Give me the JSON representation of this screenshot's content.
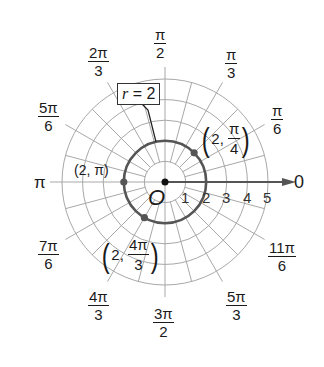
{
  "chart_data": {
    "type": "polar",
    "title": "",
    "center_label": "O",
    "radial_ticks": [
      "1",
      "2",
      "3",
      "4",
      "5"
    ],
    "r_max": 5,
    "angle_grid_step_deg": 15,
    "polar_axis_label": "0",
    "angle_labels": [
      {
        "angle": "π/6",
        "num": "π",
        "den": "6"
      },
      {
        "angle": "π/3",
        "num": "π",
        "den": "3"
      },
      {
        "angle": "π/2",
        "num": "π",
        "den": "2"
      },
      {
        "angle": "2π/3",
        "num": "2π",
        "den": "3"
      },
      {
        "angle": "5π/6",
        "num": "5π",
        "den": "6"
      },
      {
        "angle": "π",
        "text": "π"
      },
      {
        "angle": "7π/6",
        "num": "7π",
        "den": "6"
      },
      {
        "angle": "4π/3",
        "num": "4π",
        "den": "3"
      },
      {
        "angle": "3π/2",
        "num": "3π",
        "den": "2"
      },
      {
        "angle": "5π/3",
        "num": "5π",
        "den": "3"
      },
      {
        "angle": "11π/6",
        "num": "11π",
        "den": "6"
      },
      {
        "angle": "0",
        "text": "0"
      }
    ],
    "curve": {
      "equation_label": "r = 2",
      "r_var": "r",
      "r_value": "2",
      "type": "circle",
      "radius": 2
    },
    "points": [
      {
        "r": 2,
        "theta": "π/4",
        "label_r": "2",
        "label_num": "π",
        "label_den": "4"
      },
      {
        "r": 2,
        "theta": "π",
        "label": "(2, π)"
      },
      {
        "r": 2,
        "theta": "4π/3",
        "label_r": "2",
        "label_num": "4π",
        "label_den": "3"
      }
    ],
    "colors": {
      "grid": "#a8a8a8",
      "curve": "#555555",
      "axis": "#555555",
      "point": "#555555",
      "text": "#1a1a1a"
    }
  }
}
